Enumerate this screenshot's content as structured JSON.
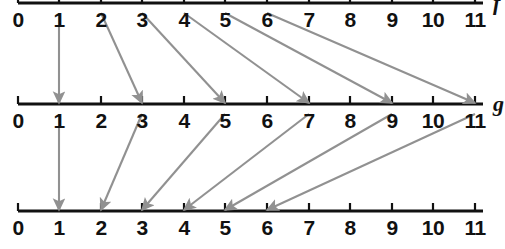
{
  "figure": {
    "width": 505,
    "height": 249,
    "background": "#ffffff",
    "axis_color": "#111111",
    "arrow_color": "#919191",
    "label_color": "#111111"
  },
  "axes": [
    {
      "id": "top",
      "name": "f",
      "name_visible": true,
      "name_clipped": true,
      "line_y": 3,
      "tick_direction": "up",
      "clipped_top": true,
      "ticks": [
        {
          "value": "0",
          "x": 18
        },
        {
          "value": "1",
          "x": 59
        },
        {
          "value": "2",
          "x": 101
        },
        {
          "value": "3",
          "x": 142
        },
        {
          "value": "4",
          "x": 184
        },
        {
          "value": "5",
          "x": 225
        },
        {
          "value": "6",
          "x": 267
        },
        {
          "value": "7",
          "x": 309
        },
        {
          "value": "8",
          "x": 350
        },
        {
          "value": "9",
          "x": 392
        },
        {
          "value": "10",
          "x": 433
        },
        {
          "value": "11",
          "x": 475
        }
      ],
      "label_y": 9
    },
    {
      "id": "middle",
      "name": "g",
      "name_visible": true,
      "name_clipped": false,
      "line_y": 104,
      "tick_direction": "up",
      "clipped_top": false,
      "ticks": [
        {
          "value": "0",
          "x": 18
        },
        {
          "value": "1",
          "x": 59
        },
        {
          "value": "2",
          "x": 101
        },
        {
          "value": "3",
          "x": 142
        },
        {
          "value": "4",
          "x": 184
        },
        {
          "value": "5",
          "x": 225
        },
        {
          "value": "6",
          "x": 267
        },
        {
          "value": "7",
          "x": 309
        },
        {
          "value": "8",
          "x": 350
        },
        {
          "value": "9",
          "x": 392
        },
        {
          "value": "10",
          "x": 433
        },
        {
          "value": "11",
          "x": 475
        }
      ],
      "label_y": 110
    },
    {
      "id": "bottom",
      "name": "",
      "name_visible": false,
      "name_clipped": true,
      "line_y": 211,
      "tick_direction": "up",
      "clipped_top": false,
      "ticks": [
        {
          "value": "0",
          "x": 18
        },
        {
          "value": "1",
          "x": 59
        },
        {
          "value": "2",
          "x": 101
        },
        {
          "value": "3",
          "x": 142
        },
        {
          "value": "4",
          "x": 184
        },
        {
          "value": "5",
          "x": 225
        },
        {
          "value": "6",
          "x": 267
        },
        {
          "value": "7",
          "x": 309
        },
        {
          "value": "8",
          "x": 350
        },
        {
          "value": "9",
          "x": 392
        },
        {
          "value": "10",
          "x": 433
        },
        {
          "value": "11",
          "x": 475
        }
      ],
      "label_y": 217
    }
  ],
  "chart_data": {
    "type": "diagram",
    "axis_min": 0,
    "axis_max": 11,
    "mappings": [
      {
        "from_axis": "top",
        "to_axis": "middle",
        "label": "f",
        "rule": "n maps to 2n-1",
        "pairs": [
          {
            "from": 1,
            "to": 1
          },
          {
            "from": 2,
            "to": 3
          },
          {
            "from": 3,
            "to": 5
          },
          {
            "from": 4,
            "to": 7
          },
          {
            "from": 5,
            "to": 9
          },
          {
            "from": 6,
            "to": 11
          }
        ]
      },
      {
        "from_axis": "middle",
        "to_axis": "bottom",
        "label": "g",
        "rule": "m maps to (m+1)/2",
        "pairs": [
          {
            "from": 1,
            "to": 1
          },
          {
            "from": 3,
            "to": 2
          },
          {
            "from": 5,
            "to": 3
          },
          {
            "from": 7,
            "to": 4
          },
          {
            "from": 9,
            "to": 5
          },
          {
            "from": 11,
            "to": 6
          }
        ]
      }
    ]
  }
}
